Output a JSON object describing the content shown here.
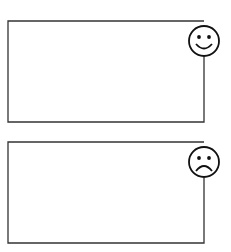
{
  "panels": [
    {
      "id": "top",
      "face": "happy",
      "icon": "smiley-face-icon",
      "box": {
        "x": 8,
        "y": 21,
        "w": 196,
        "h": 101
      },
      "face_center": {
        "cx": 204,
        "cy": 41,
        "r": 15
      }
    },
    {
      "id": "bottom",
      "face": "sad",
      "icon": "frowny-face-icon",
      "box": {
        "x": 8,
        "y": 142,
        "w": 196,
        "h": 101
      },
      "face_center": {
        "cx": 204,
        "cy": 162,
        "r": 15
      }
    }
  ],
  "colors": {
    "stroke": "#333333",
    "background": "#ffffff"
  }
}
